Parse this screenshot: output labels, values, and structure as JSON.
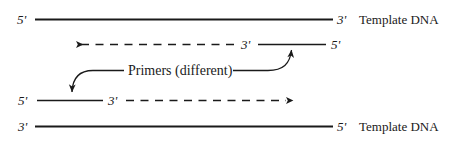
{
  "figure": {
    "background_color": "#ffffff",
    "line_color": "#1a1a1a",
    "width": 453,
    "height": 144
  },
  "strands": {
    "top_template": {
      "left_end_label": "5'",
      "right_end_label": "3'",
      "name_label": "Template DNA",
      "style": "solid"
    },
    "top_primer": {
      "extension_label": "3'",
      "right_end_label": "5'",
      "extension_style": "dashed",
      "direction": "leftward"
    },
    "bottom_primer": {
      "left_end_label": "5'",
      "extension_label": "3'",
      "extension_style": "dashed",
      "direction": "rightward"
    },
    "bottom_template": {
      "left_end_label": "3'",
      "right_end_label": "5'",
      "name_label": "Template DNA",
      "style": "solid"
    }
  },
  "annotation": {
    "primers_label": "Primers (different)"
  }
}
